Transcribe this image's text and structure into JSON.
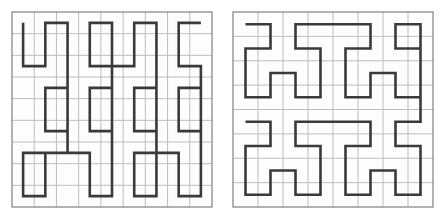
{
  "figure": {
    "title": "",
    "background_color": "#ffffff",
    "width": 447,
    "height": 218,
    "panel_count": 2
  },
  "style": {
    "grid_color": "#bdbdbd",
    "grid_stroke_width": 1,
    "border_color": "#808080",
    "border_stroke_width": 1.2,
    "curve_color": "#3a3a3a",
    "curve_stroke_width": 2.6,
    "panel_fill": "#fdfdfd"
  },
  "chart_data": {
    "type": "line",
    "title": "",
    "xlabel": "",
    "ylabel": "",
    "grid": true,
    "legend_position": "none",
    "panels": [
      {
        "name": "peano-curve",
        "label": "Peano space-filling curve",
        "grid_divisions_x": 9,
        "grid_divisions_y": 9,
        "xlim": [
          0,
          9
        ],
        "ylim": [
          0,
          9
        ],
        "order": 2,
        "points": [
          [
            0.5,
            8.5
          ],
          [
            0.5,
            6.5
          ],
          [
            1.5,
            6.5
          ],
          [
            1.5,
            8.5
          ],
          [
            2.5,
            8.5
          ],
          [
            2.5,
            6.5
          ],
          [
            2.5,
            5.5
          ],
          [
            1.5,
            5.5
          ],
          [
            1.5,
            3.5
          ],
          [
            2.5,
            3.5
          ],
          [
            2.5,
            5.5
          ],
          [
            2.5,
            3.5
          ],
          [
            2.5,
            2.5
          ],
          [
            1.5,
            2.5
          ],
          [
            1.5,
            0.5
          ],
          [
            0.5,
            0.5
          ],
          [
            0.5,
            2.5
          ],
          [
            1.5,
            2.5
          ],
          [
            2.5,
            2.5
          ],
          [
            3.5,
            2.5
          ],
          [
            3.5,
            0.5
          ],
          [
            4.5,
            0.5
          ],
          [
            4.5,
            2.5
          ],
          [
            4.5,
            3.5
          ],
          [
            3.5,
            3.5
          ],
          [
            3.5,
            5.5
          ],
          [
            4.5,
            5.5
          ],
          [
            4.5,
            3.5
          ],
          [
            4.5,
            5.5
          ],
          [
            4.5,
            6.5
          ],
          [
            3.5,
            6.5
          ],
          [
            3.5,
            8.5
          ],
          [
            4.5,
            8.5
          ],
          [
            4.5,
            6.5
          ],
          [
            5.5,
            6.5
          ],
          [
            5.5,
            8.5
          ],
          [
            6.5,
            8.5
          ],
          [
            6.5,
            6.5
          ],
          [
            6.5,
            5.5
          ],
          [
            5.5,
            5.5
          ],
          [
            5.5,
            3.5
          ],
          [
            6.5,
            3.5
          ],
          [
            6.5,
            5.5
          ],
          [
            6.5,
            2.5
          ],
          [
            5.5,
            2.5
          ],
          [
            5.5,
            0.5
          ],
          [
            6.5,
            0.5
          ],
          [
            6.5,
            2.5
          ],
          [
            7.5,
            2.5
          ],
          [
            7.5,
            0.5
          ],
          [
            8.5,
            0.5
          ],
          [
            8.5,
            2.5
          ],
          [
            8.5,
            3.5
          ],
          [
            7.5,
            3.5
          ],
          [
            7.5,
            5.5
          ],
          [
            8.5,
            5.5
          ],
          [
            8.5,
            3.5
          ],
          [
            8.5,
            6.5
          ],
          [
            7.5,
            6.5
          ],
          [
            7.5,
            8.5
          ],
          [
            8.5,
            8.5
          ]
        ]
      },
      {
        "name": "hilbert-curve",
        "label": "Hilbert space-filling curve",
        "grid_divisions_x": 8,
        "grid_divisions_y": 8,
        "xlim": [
          0,
          8
        ],
        "ylim": [
          0,
          8
        ],
        "order": 3,
        "points": [
          [
            0.5,
            7.5
          ],
          [
            1.5,
            7.5
          ],
          [
            1.5,
            6.5
          ],
          [
            0.5,
            6.5
          ],
          [
            0.5,
            5.5
          ],
          [
            0.5,
            4.5
          ],
          [
            1.5,
            4.5
          ],
          [
            1.5,
            5.5
          ],
          [
            2.5,
            5.5
          ],
          [
            2.5,
            4.5
          ],
          [
            3.5,
            4.5
          ],
          [
            3.5,
            5.5
          ],
          [
            3.5,
            6.5
          ],
          [
            2.5,
            6.5
          ],
          [
            2.5,
            7.5
          ],
          [
            3.5,
            7.5
          ],
          [
            4.5,
            7.5
          ],
          [
            5.5,
            7.5
          ],
          [
            5.5,
            6.5
          ],
          [
            4.5,
            6.5
          ],
          [
            4.5,
            5.5
          ],
          [
            4.5,
            4.5
          ],
          [
            5.5,
            4.5
          ],
          [
            5.5,
            5.5
          ],
          [
            6.5,
            5.5
          ],
          [
            6.5,
            4.5
          ],
          [
            7.5,
            4.5
          ],
          [
            7.5,
            5.5
          ],
          [
            7.5,
            6.5
          ],
          [
            6.5,
            6.5
          ],
          [
            6.5,
            7.5
          ],
          [
            7.5,
            7.5
          ],
          [
            7.5,
            3.5
          ],
          [
            6.5,
            3.5
          ],
          [
            6.5,
            2.5
          ],
          [
            7.5,
            2.5
          ],
          [
            7.5,
            1.5
          ],
          [
            7.5,
            0.5
          ],
          [
            6.5,
            0.5
          ],
          [
            6.5,
            1.5
          ],
          [
            5.5,
            1.5
          ],
          [
            5.5,
            0.5
          ],
          [
            4.5,
            0.5
          ],
          [
            4.5,
            1.5
          ],
          [
            4.5,
            2.5
          ],
          [
            5.5,
            2.5
          ],
          [
            5.5,
            3.5
          ],
          [
            4.5,
            3.5
          ],
          [
            3.5,
            3.5
          ],
          [
            2.5,
            3.5
          ],
          [
            2.5,
            2.5
          ],
          [
            3.5,
            2.5
          ],
          [
            3.5,
            1.5
          ],
          [
            3.5,
            0.5
          ],
          [
            2.5,
            0.5
          ],
          [
            2.5,
            1.5
          ],
          [
            1.5,
            1.5
          ],
          [
            1.5,
            0.5
          ],
          [
            0.5,
            0.5
          ],
          [
            0.5,
            1.5
          ],
          [
            0.5,
            2.5
          ],
          [
            1.5,
            2.5
          ],
          [
            1.5,
            3.5
          ],
          [
            0.5,
            3.5
          ]
        ]
      }
    ]
  }
}
